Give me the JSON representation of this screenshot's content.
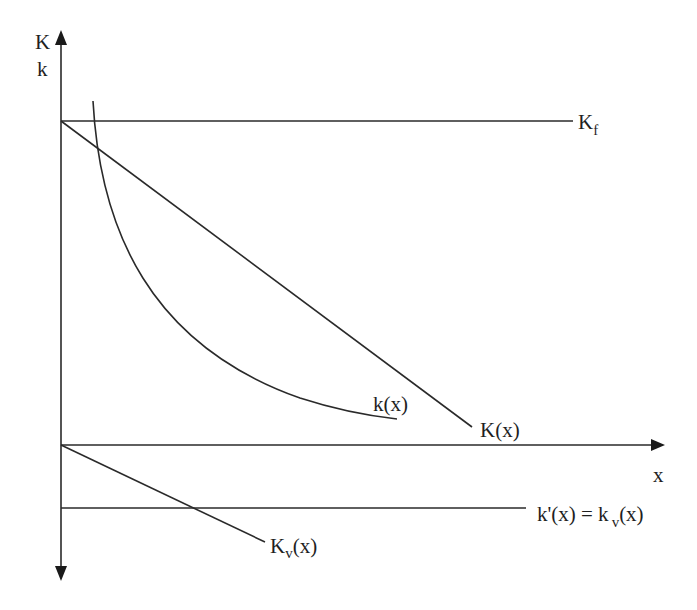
{
  "diagram": {
    "axes": {
      "vertical_label_top": "K",
      "vertical_label_bottom": "k",
      "horizontal_label": "x"
    },
    "curves": {
      "kf": {
        "main": "K",
        "sub": "f",
        "description": "horizontal line at fixed level K_f"
      },
      "K_x": {
        "label": "K(x)",
        "description": "downward-sloping straight line starting at K_f on vertical axis"
      },
      "k_x": {
        "label": "k(x)",
        "description": "convex decreasing curve (hyperbola-like)"
      },
      "Kv_x": {
        "main": "K",
        "sub": "v",
        "tail": "(x)",
        "description": "downward-sloping line below horizontal axis, starting at origin"
      },
      "k_prime": {
        "main": "k'(x) = k",
        "sub": "v",
        "tail": "(x)",
        "description": "horizontal line below horizontal axis"
      }
    },
    "colors": {
      "line": "#2a2a2a",
      "text": "#1f1f1f",
      "background": "#ffffff"
    }
  }
}
